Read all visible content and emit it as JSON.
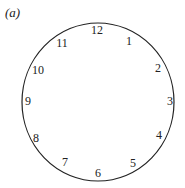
{
  "figure": {
    "label": "(a)",
    "type": "clock-face",
    "circle": {
      "cx": 98,
      "cy": 102,
      "rx": 76,
      "ry": 79,
      "stroke": "#222222"
    },
    "numerals": [
      {
        "text": "12",
        "x": 97,
        "y": 30
      },
      {
        "text": "1",
        "x": 129,
        "y": 41
      },
      {
        "text": "2",
        "x": 158,
        "y": 68
      },
      {
        "text": "3",
        "x": 170,
        "y": 101
      },
      {
        "text": "4",
        "x": 159,
        "y": 135
      },
      {
        "text": "5",
        "x": 133,
        "y": 163
      },
      {
        "text": "6",
        "x": 98,
        "y": 173
      },
      {
        "text": "7",
        "x": 65,
        "y": 162
      },
      {
        "text": "8",
        "x": 36,
        "y": 138
      },
      {
        "text": "9",
        "x": 28,
        "y": 101
      },
      {
        "text": "10",
        "x": 38,
        "y": 70
      },
      {
        "text": "11",
        "x": 62,
        "y": 43
      }
    ]
  }
}
